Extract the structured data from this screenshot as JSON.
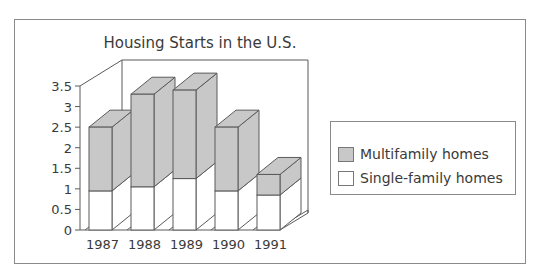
{
  "chart_data": {
    "type": "bar",
    "subtype": "3d-stacked",
    "title": "Housing Starts in the U.S.",
    "xlabel": "",
    "ylabel": "",
    "categories": [
      "1987",
      "1988",
      "1989",
      "1990",
      "1991"
    ],
    "series": [
      {
        "name": "Single-family homes",
        "color": "#ffffff",
        "values": [
          0.95,
          1.05,
          1.25,
          0.95,
          0.85
        ]
      },
      {
        "name": "Multifamily homes",
        "color": "#c8c8c8",
        "values": [
          1.55,
          2.25,
          2.15,
          1.55,
          0.5
        ]
      }
    ],
    "totals": [
      2.5,
      3.3,
      3.4,
      2.5,
      1.35
    ],
    "ylim": [
      0,
      3.5
    ],
    "yticks": [
      "0",
      "0.5",
      "1",
      "1.5",
      "2",
      "2.5",
      "3",
      "3.5"
    ],
    "grid": false,
    "legend_position": "right"
  },
  "legend": {
    "items": [
      {
        "label": "Multifamily homes",
        "color": "#c8c8c8"
      },
      {
        "label": "Single-family homes",
        "color": "#ffffff"
      }
    ]
  }
}
